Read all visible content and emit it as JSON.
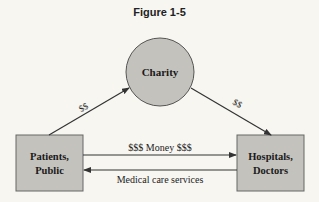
{
  "figure": {
    "title": "Figure 1-5"
  },
  "nodes": {
    "charity": {
      "label": "Charity"
    },
    "patients": {
      "line1": "Patients,",
      "line2": "Public"
    },
    "hospitals": {
      "line1": "Hospitals,",
      "line2": "Doctors"
    }
  },
  "edges": {
    "patients_to_charity": {
      "label": "$$"
    },
    "charity_to_hospitals": {
      "label": "$$"
    },
    "money": {
      "label": "$$$ Money $$$"
    },
    "care": {
      "label": "Medical care services"
    }
  },
  "colors": {
    "background": "#f7f6f1",
    "node_fill": "#c4c2bd",
    "stroke": "#333333",
    "text": "#1a1a1a"
  }
}
